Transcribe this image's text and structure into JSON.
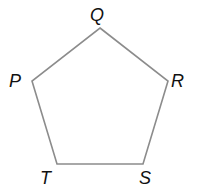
{
  "diagram": {
    "shape": "regular pentagon",
    "stroke_color": "#8c8c8c",
    "label_color": "#111111",
    "vertices": [
      {
        "name": "Q",
        "x": 100,
        "y": 28,
        "label_x": 90,
        "label_y": 21
      },
      {
        "name": "R",
        "x": 168,
        "y": 81,
        "label_x": 171,
        "label_y": 87
      },
      {
        "name": "S",
        "x": 143,
        "y": 164,
        "label_x": 139,
        "label_y": 184
      },
      {
        "name": "T",
        "x": 57,
        "y": 164,
        "label_x": 40,
        "label_y": 184
      },
      {
        "name": "P",
        "x": 32,
        "y": 81,
        "label_x": 9,
        "label_y": 87
      }
    ]
  }
}
